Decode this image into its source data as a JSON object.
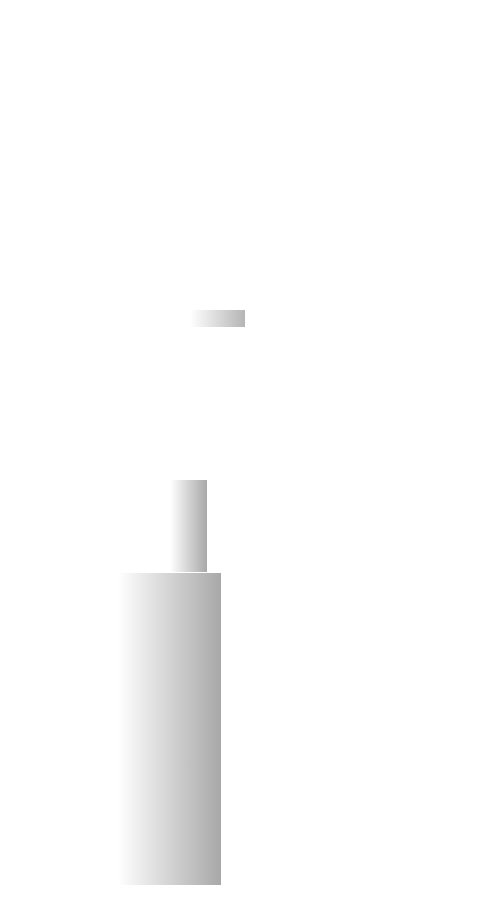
{
  "figure": {
    "colors": {
      "background": "#ffffff",
      "gray_branch": "#a9a9a9",
      "black_branch": "#111111",
      "mid_branch": "#555555",
      "shade_dark": "#a8a8a8",
      "shade_light": "#ffffff",
      "label_text": "#222222",
      "arrow": "#333333"
    },
    "clades": [
      {
        "name": "ameerega-clade",
        "style": "mid",
        "shaded": true
      },
      {
        "name": "dendrobates-clade",
        "style": "black",
        "shaded": true
      },
      {
        "name": "other-dendrobatids",
        "style": "gray",
        "shaded": false
      }
    ],
    "species": [
      {
        "id": "talamancae",
        "label": "Colostethus talamancae",
        "frog": "striped-brown"
      },
      {
        "id": "femoralis",
        "label": "Allobates femoralis",
        "frog": "striped-dark"
      },
      {
        "id": "zaparo",
        "label": "Allobates zaparo",
        "frog": "mottled-dark"
      },
      {
        "id": "sauli",
        "label": "Colostethus sauli",
        "frog": "red-brown"
      },
      {
        "id": "azureiventris",
        "label": "Hyloxalus azureiventris",
        "frog": "striped-spotted"
      },
      {
        "id": "infraguttatus",
        "label": "Colostethus infraguttatus",
        "frog": "striped-brown"
      },
      {
        "id": "machalilla",
        "label": "Colostethus machalilla",
        "frog": "red-brown"
      },
      {
        "id": "tricolor",
        "label": "Epipedobates tricolor",
        "frog": "striped-light"
      },
      {
        "id": "fugax",
        "label": "Colostethus fugax",
        "frog": "striped-brown"
      },
      {
        "id": "parvulus",
        "label": "Ameerega parvulus",
        "frog": "red-brown"
      },
      {
        "id": "bicolor",
        "label": "Phyllobates bicolor",
        "frog": "pale-yellow"
      },
      {
        "id": "leucomelas",
        "label": "Dendrobates leucomelas",
        "frog": "banded-black"
      },
      {
        "id": "tinctorius",
        "label": "Dendrobates tinctorius",
        "frog": "spotted-blue"
      },
      {
        "id": "reticulatus",
        "label": "Dendrobates reticulatus",
        "frog": "reticulated-red"
      }
    ]
  }
}
